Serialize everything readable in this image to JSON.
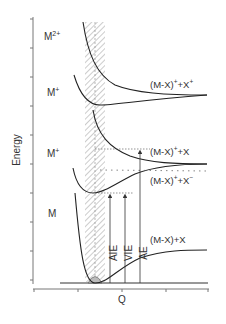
{
  "diagram": {
    "axes": {
      "y_label": "Energy",
      "x_label": "Q"
    },
    "states": [
      {
        "id": "M2plus",
        "label": "M",
        "superscript": "2+"
      },
      {
        "id": "Mplus_upper",
        "label": "M",
        "superscript": "+"
      },
      {
        "id": "Mplus_lower",
        "label": "M",
        "superscript": "+"
      },
      {
        "id": "M",
        "label": "M",
        "superscript": ""
      }
    ],
    "asymptote_labels": [
      {
        "id": "mx_plus_x_plus",
        "text": "(M-X)",
        "sup1": "+",
        "mid": "+X",
        "sup2": "+"
      },
      {
        "id": "mx_plus_x",
        "text": "(M-X)",
        "sup1": "+",
        "mid": "+X",
        "sup2": ""
      },
      {
        "id": "mx_plus_x_minus",
        "text": "(M-X)",
        "sup1": "+",
        "mid": "+X",
        "sup2": "−"
      },
      {
        "id": "mx_x",
        "text": "(M-X)+X",
        "sup1": "",
        "mid": "",
        "sup2": ""
      }
    ],
    "arrows": [
      {
        "id": "aie",
        "label": "AIE"
      },
      {
        "id": "vie",
        "label": "VIE"
      },
      {
        "id": "ae",
        "label": "AE"
      }
    ],
    "colors": {
      "line": "#222222",
      "axis": "#777777",
      "hatch": "#999999",
      "dotted": "#666666",
      "text": "#333333"
    }
  }
}
